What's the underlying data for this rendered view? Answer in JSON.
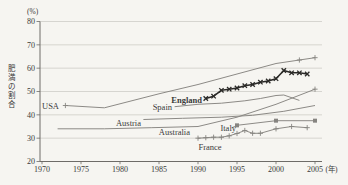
{
  "figure": {
    "background": "#f6f5f1",
    "description_visible_text_only": true
  },
  "chart_data": {
    "type": "line",
    "title": "",
    "ylabel": "肥満の割合",
    "y_unit_label": "(%)",
    "x_unit_label": "(年)",
    "x_ticks": [
      1970,
      1975,
      1980,
      1985,
      1990,
      1995,
      2000,
      2005
    ],
    "y_ticks": [
      20,
      30,
      40,
      50,
      60,
      70,
      80
    ],
    "xlim": [
      1969.7,
      2006.0
    ],
    "ylim": [
      20,
      80
    ],
    "grid": true,
    "legend_position": "inline-labels",
    "colors": {
      "line_gray": "#868480",
      "england_line": "#2b2a28",
      "grid_line": "#c9c7c1",
      "axis_line": "#6e6c68",
      "text": "#3a3936"
    },
    "series": [
      {
        "name": "USA",
        "bold": false,
        "marker": "plus",
        "marker_at": [
          1973,
          2003,
          2005
        ],
        "points": [
          [
            1973,
            44
          ],
          [
            1978,
            43
          ],
          [
            1985,
            49
          ],
          [
            1990,
            53
          ],
          [
            1995,
            57.5
          ],
          [
            2000,
            62
          ],
          [
            2003,
            63.5
          ],
          [
            2005,
            64.5
          ]
        ]
      },
      {
        "name": "England",
        "bold": true,
        "marker": "x",
        "marker_at": "all",
        "points": [
          [
            1991,
            47
          ],
          [
            1992,
            48
          ],
          [
            1993,
            50.5
          ],
          [
            1994,
            51
          ],
          [
            1995,
            51.5
          ],
          [
            1996,
            52.5
          ],
          [
            1997,
            53
          ],
          [
            1998,
            54
          ],
          [
            1999,
            54.5
          ],
          [
            2000,
            55.5
          ],
          [
            2001,
            59
          ],
          [
            2002,
            58
          ],
          [
            2003,
            58
          ],
          [
            2004,
            57.5
          ]
        ]
      },
      {
        "name": "Spain",
        "bold": false,
        "marker": "none",
        "marker_at": [],
        "points": [
          [
            1987,
            43.5
          ],
          [
            1990,
            44.5
          ],
          [
            1993,
            45
          ],
          [
            1996,
            46
          ],
          [
            1998,
            47
          ],
          [
            2000,
            48.3
          ],
          [
            2001,
            48.5
          ],
          [
            2003,
            46.2
          ]
        ]
      },
      {
        "name": "Austria",
        "bold": false,
        "marker": "none",
        "marker_at": [],
        "points": [
          [
            1983,
            38
          ],
          [
            1988,
            38.5
          ],
          [
            1993,
            39
          ],
          [
            1997,
            39.8
          ],
          [
            2001,
            41.5
          ],
          [
            2005,
            44
          ]
        ]
      },
      {
        "name": "Australia",
        "bold": false,
        "marker": "plus",
        "marker_at": [
          2005
        ],
        "points": [
          [
            1972,
            34
          ],
          [
            1978,
            34
          ],
          [
            1984,
            34.5
          ],
          [
            1990,
            35
          ],
          [
            1995,
            39
          ],
          [
            2000,
            44.5
          ],
          [
            2005,
            51
          ]
        ]
      },
      {
        "name": "Italy",
        "bold": false,
        "marker": "square",
        "marker_at": "all",
        "points": [
          [
            1995,
            35.5
          ],
          [
            2000,
            37.5
          ],
          [
            2005,
            37.5
          ]
        ]
      },
      {
        "name": "France",
        "bold": false,
        "marker": "plus",
        "marker_at": "all",
        "points": [
          [
            1990,
            30
          ],
          [
            1991,
            30.2
          ],
          [
            1992,
            30.4
          ],
          [
            1993,
            30.4
          ],
          [
            1994,
            31
          ],
          [
            1995,
            32
          ],
          [
            1996,
            33.3
          ],
          [
            1997,
            32.1
          ],
          [
            1998,
            32.1
          ],
          [
            2000,
            34
          ],
          [
            2002,
            35
          ],
          [
            2004,
            34.5
          ]
        ]
      }
    ],
    "series_labels": [
      {
        "text": "USA",
        "x": 42,
        "y": 109,
        "anchor": "start",
        "bold": false
      },
      {
        "text": "England",
        "x": 202,
        "y": 103,
        "anchor": "end",
        "bold": true
      },
      {
        "text": "Spain",
        "x": 172,
        "y": 109.5,
        "anchor": "end",
        "bold": false
      },
      {
        "text": "Austria",
        "x": 141,
        "y": 126,
        "anchor": "end",
        "bold": false
      },
      {
        "text": "Australia",
        "x": 190,
        "y": 134.5,
        "anchor": "end",
        "bold": false
      },
      {
        "text": "Italy",
        "x": 236,
        "y": 130.5,
        "anchor": "end",
        "bold": false
      },
      {
        "text": "France",
        "x": 210,
        "y": 149.5,
        "anchor": "middle",
        "bold": false
      }
    ],
    "leader_lines": [
      {
        "for": "Italy",
        "x1": 231.5,
        "y1": 127.8,
        "x2": 236.5,
        "y2": 125.6
      }
    ]
  }
}
